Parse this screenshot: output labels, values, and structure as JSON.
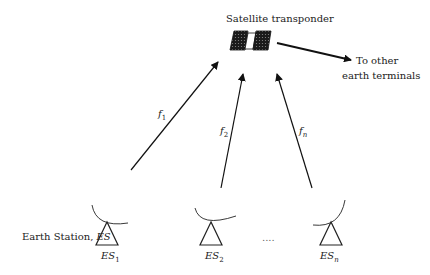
{
  "diagram": {
    "title": "Satellite transponder",
    "output_label_line1": "To other",
    "output_label_line2": "earth terminals",
    "earth_station_label": "Earth Station, ",
    "earth_station_symbol": "ES",
    "ellipsis": "....",
    "links": [
      {
        "freq": "f",
        "sub": "1"
      },
      {
        "freq": "f",
        "sub": "2"
      },
      {
        "freq": "f",
        "sub": "n"
      }
    ],
    "stations": [
      {
        "name": "ES",
        "sub": "1"
      },
      {
        "name": "ES",
        "sub": "2"
      },
      {
        "name": "ES",
        "sub": "n"
      }
    ]
  }
}
